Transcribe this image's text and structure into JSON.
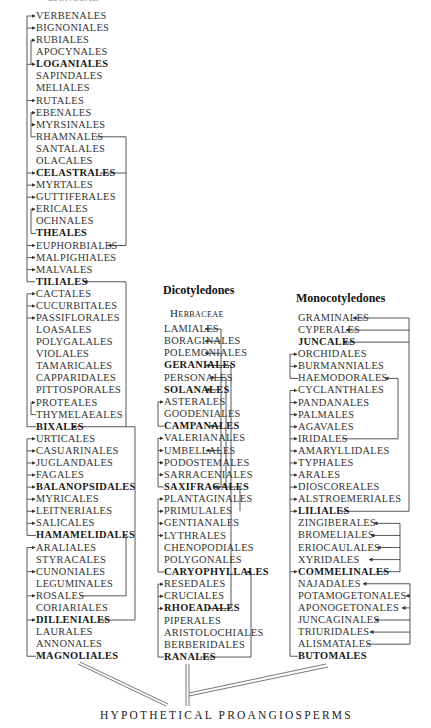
{
  "top_partial_label": "LIGNOSAE",
  "left_column": {
    "items": [
      {
        "label": "VERBENALES",
        "bold": false
      },
      {
        "label": "BIGNONIALES",
        "bold": false
      },
      {
        "label": "RUBIALES",
        "bold": false
      },
      {
        "label": "APOCYNALES",
        "bold": false
      },
      {
        "label": "LOGANIALES",
        "bold": true
      },
      {
        "label": "SAPINDALES",
        "bold": false
      },
      {
        "label": "MELIALES",
        "bold": false
      },
      {
        "label": "RUTALES",
        "bold": false
      },
      {
        "label": "EBENALES",
        "bold": false
      },
      {
        "label": "MYRSINALES",
        "bold": false
      },
      {
        "label": "RHAMNALES",
        "bold": false
      },
      {
        "label": "SANTALALES",
        "bold": false
      },
      {
        "label": "OLACALES",
        "bold": false
      },
      {
        "label": "CELASTRALES",
        "bold": true
      },
      {
        "label": "MYRTALES",
        "bold": false
      },
      {
        "label": "GUTTIFERALES",
        "bold": false
      },
      {
        "label": "ERICALES",
        "bold": false
      },
      {
        "label": "OCHNALES",
        "bold": false
      },
      {
        "label": "THEALES",
        "bold": true
      },
      {
        "label": "EUPHORBIALES",
        "bold": false
      },
      {
        "label": "MALPIGHIALES",
        "bold": false
      },
      {
        "label": "MALVALES",
        "bold": false
      },
      {
        "label": "TILIALES",
        "bold": true
      },
      {
        "label": "CACTALES",
        "bold": false
      },
      {
        "label": "CUCURBITALES",
        "bold": false
      },
      {
        "label": "PASSIFLORALES",
        "bold": false
      },
      {
        "label": "LOASALES",
        "bold": false
      },
      {
        "label": "POLYGALALES",
        "bold": false
      },
      {
        "label": "VIOLALES",
        "bold": false
      },
      {
        "label": "TAMARICALES",
        "bold": false
      },
      {
        "label": "CAPPARIDALES",
        "bold": false
      },
      {
        "label": "PITTOSPORALES",
        "bold": false
      },
      {
        "label": "PROTEALES",
        "bold": false
      },
      {
        "label": "THYMELAEALES",
        "bold": false
      },
      {
        "label": "BIXALES",
        "bold": true
      },
      {
        "label": "URTICALES",
        "bold": false
      },
      {
        "label": "CASUARINALES",
        "bold": false
      },
      {
        "label": "JUGLANDALES",
        "bold": false
      },
      {
        "label": "FAGALES",
        "bold": false
      },
      {
        "label": "BALANOPSIDALES",
        "bold": true
      },
      {
        "label": "MYRICALES",
        "bold": false
      },
      {
        "label": "LEITNERIALES",
        "bold": false
      },
      {
        "label": "SALICALES",
        "bold": false
      },
      {
        "label": "HAMAMELIDALES",
        "bold": true
      },
      {
        "label": "ARALIALES",
        "bold": false
      },
      {
        "label": "STYRACALES",
        "bold": false
      },
      {
        "label": "CUNONIALES",
        "bold": false
      },
      {
        "label": "LEGUMINALES",
        "bold": false
      },
      {
        "label": "ROSALES",
        "bold": false
      },
      {
        "label": "CORIARIALES",
        "bold": false
      },
      {
        "label": "DILLENIALES",
        "bold": true
      },
      {
        "label": "LAURALES",
        "bold": false
      },
      {
        "label": "ANNONALES",
        "bold": false
      },
      {
        "label": "MAGNOLIALES",
        "bold": true
      }
    ]
  },
  "middle_column": {
    "heading": "Dicotyledones",
    "subheading": "Herbaceae",
    "items": [
      {
        "label": "LAMIALES",
        "bold": false
      },
      {
        "label": "BORAGINALES",
        "bold": false
      },
      {
        "label": "POLEMONIALES",
        "bold": false
      },
      {
        "label": "GERANIALES",
        "bold": true
      },
      {
        "label": "PERSONALES",
        "bold": false
      },
      {
        "label": "SOLANALES",
        "bold": true
      },
      {
        "label": "ASTERALES",
        "bold": false
      },
      {
        "label": "GOODENIALES",
        "bold": false
      },
      {
        "label": "CAMPANALES",
        "bold": true
      },
      {
        "label": "VALERIANALES",
        "bold": false
      },
      {
        "label": "UMBELLALES",
        "bold": false
      },
      {
        "label": "PODOSTEMALES",
        "bold": false
      },
      {
        "label": "SARRACENIALES",
        "bold": false
      },
      {
        "label": "SAXIFRAGALES",
        "bold": true
      },
      {
        "label": "PLANTAGINALES",
        "bold": false
      },
      {
        "label": "PRIMULALES",
        "bold": false
      },
      {
        "label": "GENTIANALES",
        "bold": false
      },
      {
        "label": "LYTHRALES",
        "bold": false
      },
      {
        "label": "CHENOPODIALES",
        "bold": false
      },
      {
        "label": "POLYGONALES",
        "bold": false
      },
      {
        "label": "CARYOPHYLLALES",
        "bold": true
      },
      {
        "label": "RESEDALES",
        "bold": false
      },
      {
        "label": "CRUCIALES",
        "bold": false
      },
      {
        "label": "RHOEADALES",
        "bold": true
      },
      {
        "label": "PIPERALES",
        "bold": false
      },
      {
        "label": "ARISTOLOCHIALES",
        "bold": false
      },
      {
        "label": "BERBERIDALES",
        "bold": false
      },
      {
        "label": "RANALES",
        "bold": true
      }
    ]
  },
  "right_column": {
    "heading": "Monocotyledones",
    "items": [
      {
        "label": "GRAMINALES",
        "bold": false
      },
      {
        "label": "CYPERALES",
        "bold": false
      },
      {
        "label": "JUNCALES",
        "bold": true
      },
      {
        "label": "ORCHIDALES",
        "bold": false
      },
      {
        "label": "BURMANNIALES",
        "bold": false
      },
      {
        "label": "HAEMODORALES",
        "bold": false
      },
      {
        "label": "CYCLANTHALES",
        "bold": false
      },
      {
        "label": "PANDANALES",
        "bold": false
      },
      {
        "label": "PALMALES",
        "bold": false
      },
      {
        "label": "AGAVALES",
        "bold": false
      },
      {
        "label": "IRIDALES",
        "bold": false
      },
      {
        "label": "AMARYLLIDALES",
        "bold": false
      },
      {
        "label": "TYPHALES",
        "bold": false
      },
      {
        "label": "ARALES",
        "bold": false
      },
      {
        "label": "DIOSCOREALES",
        "bold": false
      },
      {
        "label": "ALSTROEMERIALES",
        "bold": false
      },
      {
        "label": "LILIALES",
        "bold": true
      },
      {
        "label": "ZINGIBERALES",
        "bold": false
      },
      {
        "label": "BROMELIALES",
        "bold": false
      },
      {
        "label": "ERIOCAULALES",
        "bold": false
      },
      {
        "label": "XYRIDALES",
        "bold": false
      },
      {
        "label": "COMMELINALES",
        "bold": true
      },
      {
        "label": "NAJADALES",
        "bold": false
      },
      {
        "label": "POTAMOGETONALES",
        "bold": false
      },
      {
        "label": "APONOGETONALES",
        "bold": false
      },
      {
        "label": "JUNCAGINALES",
        "bold": false
      },
      {
        "label": "TRIURIDALES",
        "bold": false
      },
      {
        "label": "ALISMATALES",
        "bold": false
      },
      {
        "label": "BUTOMALES",
        "bold": true
      }
    ]
  },
  "footer": {
    "root_label": "HYPOTHETICAL PROANGIOSPERMS"
  }
}
